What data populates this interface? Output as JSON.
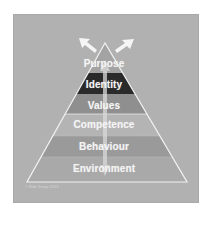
{
  "diagram": {
    "type": "pyramid",
    "levels": [
      {
        "label": "Purpose",
        "color": "#a3a3a3"
      },
      {
        "label": "Identity",
        "color": "#2a2a2a"
      },
      {
        "label": "Values",
        "color": "#8f8f8f"
      },
      {
        "label": "Competence",
        "color": "#b4b4b4"
      },
      {
        "label": "Behaviour",
        "color": "#9a9a9a"
      },
      {
        "label": "Environment",
        "color": "#a9a9a9"
      }
    ],
    "background_color": "#b1b1b1",
    "outline_color": "#f2f2f2",
    "arrows": {
      "top_left": "arrow-up-left",
      "top_right": "arrow-up-right",
      "center": "double-arrow-vertical"
    },
    "copyright": "© Bob Group 2013"
  }
}
